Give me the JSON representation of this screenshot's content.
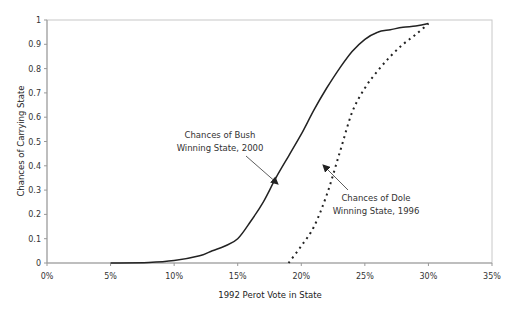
{
  "chart_data": {
    "type": "line",
    "title": "",
    "xlabel": "1992 Perot Vote in State",
    "ylabel": "Chances of Carrying State",
    "xlim": [
      0,
      35
    ],
    "ylim": [
      0,
      1
    ],
    "x_ticks": [
      "0%",
      "5%",
      "10%",
      "15%",
      "20%",
      "25%",
      "30%",
      "35%"
    ],
    "x_tick_values": [
      0,
      5,
      10,
      15,
      20,
      25,
      30,
      35
    ],
    "y_ticks": [
      "0",
      "0.1",
      "0.2",
      "0.3",
      "0.4",
      "0.5",
      "0.6",
      "0.7",
      "0.8",
      "0.9",
      "1"
    ],
    "y_tick_values": [
      0,
      0.1,
      0.2,
      0.3,
      0.4,
      0.5,
      0.6,
      0.7,
      0.8,
      0.9,
      1
    ],
    "grid": false,
    "legend": "none (inline annotations)",
    "series": [
      {
        "name": "Chances of Bush Winning State, 2000",
        "style": "solid",
        "x": [
          5,
          8,
          10,
          12,
          13,
          14,
          15,
          16,
          17,
          18,
          19,
          20,
          21,
          22,
          23,
          24,
          25,
          26,
          27,
          28,
          29,
          30
        ],
        "values": [
          0,
          0.002,
          0.01,
          0.03,
          0.05,
          0.07,
          0.1,
          0.17,
          0.25,
          0.35,
          0.44,
          0.53,
          0.63,
          0.72,
          0.8,
          0.87,
          0.92,
          0.95,
          0.96,
          0.97,
          0.975,
          0.985
        ]
      },
      {
        "name": "Chances of Dole Winning State, 1996",
        "style": "dotted",
        "x": [
          19,
          20,
          21,
          22,
          23,
          24,
          25,
          26,
          27,
          28,
          29,
          30
        ],
        "values": [
          0,
          0.07,
          0.15,
          0.28,
          0.45,
          0.62,
          0.72,
          0.79,
          0.85,
          0.9,
          0.94,
          0.985
        ]
      }
    ],
    "annotations": [
      {
        "lines": [
          "Chances of Bush",
          "Winning State, 2000"
        ],
        "points_to": "Bush curve near 18.5%, 0.36"
      },
      {
        "lines": [
          "Chances of Dole",
          "Winning State, 1996"
        ],
        "points_to": "Dole curve near 22.5%, 0.41"
      }
    ]
  },
  "colors": {
    "axis": "#999999",
    "line": "#222222",
    "text": "#333333"
  },
  "layout": {
    "plot_left": 47,
    "plot_right": 492,
    "plot_top": 20,
    "plot_bottom": 263
  }
}
